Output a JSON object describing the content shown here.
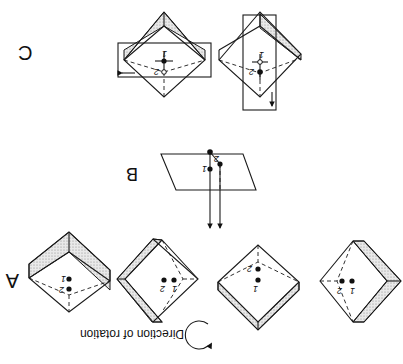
{
  "figure": {
    "orientation": "rotated 180 degrees",
    "panels": {
      "A": {
        "label": "A",
        "legend": {
          "text": "Direction of rotation",
          "icon": "clockwise-rotation-arrow-icon"
        },
        "cubes": [
          {
            "points": [
              {
                "label": "1"
              },
              {
                "label": "2"
              }
            ]
          },
          {
            "points": [
              {
                "label": "1"
              },
              {
                "label": "2"
              }
            ]
          },
          {
            "points": [
              {
                "label": "1"
              },
              {
                "label": "2"
              }
            ]
          },
          {
            "points": [
              {
                "label": "1"
              },
              {
                "label": "2"
              }
            ]
          }
        ]
      },
      "B": {
        "label": "B",
        "points": [
          {
            "label": "1"
          },
          {
            "label": "2"
          }
        ]
      },
      "C": {
        "label": "C",
        "cubes": [
          {
            "points": [
              {
                "label": "1"
              },
              {
                "label": "2"
              }
            ]
          },
          {
            "points": [
              {
                "label": "1"
              },
              {
                "label": "2"
              }
            ]
          }
        ]
      }
    }
  }
}
